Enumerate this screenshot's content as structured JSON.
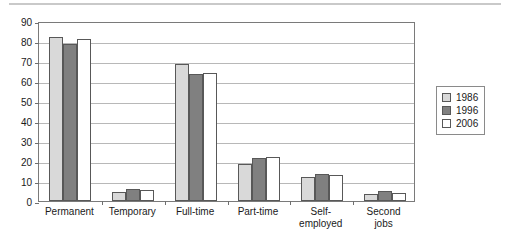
{
  "chart_data": {
    "type": "bar",
    "title": "",
    "subtitle": "",
    "xlabel": "",
    "ylabel": "",
    "ylim": [
      0,
      90
    ],
    "ytick_step": 10,
    "yticks": [
      "0",
      "10",
      "20",
      "30",
      "40",
      "50",
      "60",
      "70",
      "80",
      "90"
    ],
    "grid": true,
    "legend_position": "right",
    "categories": [
      "Permanent",
      "Temporary",
      "Full-time",
      "Part-time",
      "Self-\nemployed",
      "Second\njobs"
    ],
    "series": [
      {
        "name": "1986",
        "color": "#d9d9d9",
        "values": [
          82,
          4.5,
          68.5,
          18.5,
          11.8,
          3.5
        ]
      },
      {
        "name": "1996",
        "color": "#808080",
        "values": [
          78.5,
          6,
          63.5,
          21.5,
          13.7,
          5.2
        ]
      },
      {
        "name": "2006",
        "color": "#ffffff",
        "values": [
          81,
          5.5,
          64,
          22,
          13,
          3.8
        ]
      }
    ]
  },
  "legend": {
    "entries": [
      {
        "label": "1986",
        "color": "#d9d9d9"
      },
      {
        "label": "1996",
        "color": "#808080"
      },
      {
        "label": "2006",
        "color": "#ffffff"
      }
    ]
  },
  "colors": {
    "series_1986": "#d9d9d9",
    "series_1996": "#808080",
    "series_2006": "#ffffff",
    "bar_border": "#585858",
    "axis": "#7a7a7a",
    "gridline": "#b8b8b8",
    "text": "#1a1a1a",
    "top_rule": "#c9c9c9"
  }
}
